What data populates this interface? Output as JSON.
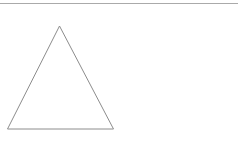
{
  "canvas": {
    "width": 238,
    "height": 145,
    "background_color": "#ffffff"
  },
  "figure": {
    "title": "",
    "shapes": [
      {
        "name": "horizontal-rule",
        "type": "line",
        "x1": 0,
        "y1": 3.5,
        "x2": 238,
        "y2": 3.5,
        "stroke": "#aaaaaa",
        "stroke_width": 1,
        "fill": "none"
      },
      {
        "name": "triangle",
        "type": "polygon",
        "points": "59.5,26 113.5,129 7.5,129",
        "vertices": [
          {
            "label": "apex",
            "x": 59.5,
            "y": 26
          },
          {
            "label": "bottom-right",
            "x": 113.5,
            "y": 129
          },
          {
            "label": "bottom-left",
            "x": 7.5,
            "y": 129
          }
        ],
        "stroke": "#8c8c8c",
        "stroke_width": 1,
        "fill": "none"
      }
    ]
  }
}
